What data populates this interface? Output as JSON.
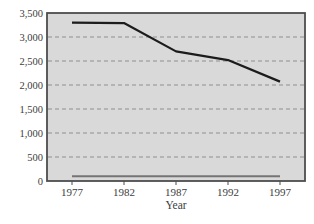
{
  "chart_data": {
    "type": "line",
    "title": "",
    "xlabel": "Year",
    "ylabel": "",
    "categories": [
      "1977",
      "1982",
      "1987",
      "1992",
      "1997"
    ],
    "series": [
      {
        "name": "upper-line",
        "color": "#1c1c1c",
        "width": 2.2,
        "values": [
          3300,
          3290,
          2700,
          2520,
          2070
        ]
      },
      {
        "name": "lower-line",
        "color": "#747474",
        "width": 2,
        "values": [
          100,
          100,
          100,
          100,
          100
        ]
      }
    ],
    "ylim": [
      0,
      3500
    ],
    "ytick_step": 500,
    "ytick_labels": [
      "0",
      "500",
      "1,000",
      "1,500",
      "2,000",
      "2,500",
      "3,000",
      "3,500"
    ],
    "grid": "horizontal-dashed",
    "legend": "none",
    "colors": {
      "plot_bg": "#d9d9d9",
      "frame": "#4d4d4d",
      "gridline": "#8f8f8f",
      "text": "#3d3d3d",
      "page_bg": "#ffffff"
    }
  }
}
